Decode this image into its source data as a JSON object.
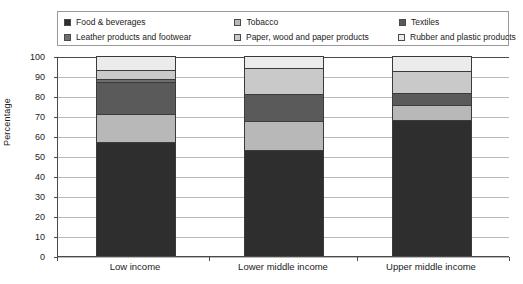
{
  "chart_data": {
    "type": "bar",
    "stacked": true,
    "title": "",
    "xlabel": "",
    "ylabel": "Percentage",
    "ylim": [
      0,
      100
    ],
    "ytick_step": 10,
    "yticks": [
      0,
      10,
      20,
      30,
      40,
      50,
      60,
      70,
      80,
      90,
      100
    ],
    "grid": true,
    "legend_position": "top",
    "categories": [
      "Low income",
      "Lower middle income",
      "Upper middle income"
    ],
    "series": [
      {
        "name": "Food & beverages",
        "color": "#2e2e2e",
        "values": [
          57,
          53,
          68
        ]
      },
      {
        "name": "Tobacco",
        "color": "#b8b8b8",
        "values": [
          14,
          14.5,
          7.5
        ]
      },
      {
        "name": "Textiles",
        "color": "#5a5a5a",
        "values": [
          16,
          13.5,
          6
        ]
      },
      {
        "name": "Leather products and footwear",
        "color": "#6e6e6e",
        "values": [
          1.5,
          0,
          0
        ]
      },
      {
        "name": "Paper, wood and paper products",
        "color": "#c9c9c9",
        "values": [
          4.5,
          13,
          11
        ]
      },
      {
        "name": "Rubber and plastic products",
        "color": "#ebebeb",
        "values": [
          7,
          6,
          7.5
        ]
      }
    ]
  },
  "legend": {
    "rows": [
      [
        {
          "label": "Food & beverages",
          "color": "#2e2e2e"
        },
        {
          "label": "Tobacco",
          "color": "#b8b8b8"
        },
        {
          "label": "Textiles",
          "color": "#5a5a5a"
        }
      ],
      [
        {
          "label": "Leather products and footwear",
          "color": "#6e6e6e"
        },
        {
          "label": "Paper, wood and paper products",
          "color": "#c9c9c9"
        },
        {
          "label": "Rubber and plastic products",
          "color": "#ebebeb"
        }
      ]
    ]
  }
}
